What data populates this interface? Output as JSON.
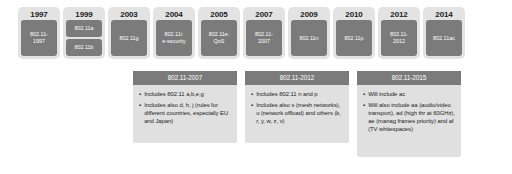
{
  "diagram": {
    "colors": {
      "card_background": "#e3e3e3",
      "standard_box": "#7b7b7b",
      "panel_background": "#e0e0e0",
      "panel_header": "#7b7b7b",
      "page_background": "#ffffff",
      "text_dark": "#1b1b1b",
      "text_light": "#ffffff"
    }
  },
  "timeline": {
    "entries": [
      {
        "year": "1997",
        "standards": [
          "802.11-",
          "1997"
        ],
        "multi": false
      },
      {
        "year": "1999",
        "standards": [
          "802.11a",
          "802.11b"
        ],
        "multi": true
      },
      {
        "year": "2003",
        "standards": [
          "802.11g"
        ],
        "multi": false
      },
      {
        "year": "2004",
        "standards": [
          "802.11i:",
          "e-security"
        ],
        "multi": false
      },
      {
        "year": "2005",
        "standards": [
          "802.11e:",
          "QoS"
        ],
        "multi": false
      },
      {
        "year": "2007",
        "standards": [
          "802.11-",
          "2007"
        ],
        "multi": false
      },
      {
        "year": "2009",
        "standards": [
          "802.11n"
        ],
        "multi": false
      },
      {
        "year": "2010",
        "standards": [
          "802.11p"
        ],
        "multi": false
      },
      {
        "year": "2012",
        "standards": [
          "802.11-",
          "2012"
        ],
        "multi": false
      },
      {
        "year": "2014",
        "standards": [
          "802.11ac"
        ],
        "multi": false
      }
    ]
  },
  "panels": [
    {
      "header": "802.11-2007",
      "bullets": [
        "Includes 802.11 a,b,e,g",
        "Includes also d, h, j (rules for different countries, especially EU and Japan)"
      ]
    },
    {
      "header": "802.11-2012",
      "bullets": [
        "Includes 802.11 n and p",
        "Includes also s (mesh networks), u (network offload) and others (k, r, y, w, z, v)"
      ]
    },
    {
      "header": "802.11-2015",
      "bullets": [
        "Will include ac",
        "Will also include aa (audio/video transport), ad (high thr at 60GHz), ae (manag frames priority) and af (TV whitespaces)"
      ]
    }
  ]
}
